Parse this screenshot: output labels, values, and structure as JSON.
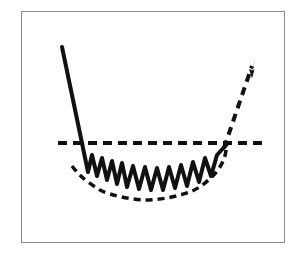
{
  "figure": {
    "title": "Market bottoming and recovery pattern",
    "background_color": "#ffffff",
    "frame": {
      "border_color": "#8a8a8a",
      "border_width": 1,
      "x": 21,
      "y": 11,
      "width": 264,
      "height": 232
    },
    "stroke_color": "#111111"
  },
  "chart_data": {
    "type": "line",
    "title": "Market bottoming and recovery pattern",
    "subtitle": "",
    "xlabel": "",
    "ylabel": "",
    "xlim": [
      0,
      297
    ],
    "ylim": [
      265,
      0
    ],
    "grid": false,
    "legend": "none",
    "annotations": [
      {
        "name": "support-level",
        "text": "",
        "style": "horizontal dashed reference line",
        "y": 143
      },
      {
        "name": "uptrend-arrow",
        "text": "",
        "style": "dashed arrow pointing up-right",
        "tip_x": 256,
        "tip_y": 57
      }
    ],
    "series": [
      {
        "name": "decline-and-oscillation",
        "style": "solid",
        "color": "#111111",
        "width": 4,
        "points": [
          [
            62,
            47
          ],
          [
            88,
            172
          ],
          [
            92,
            155
          ],
          [
            97,
            176
          ],
          [
            102,
            158
          ],
          [
            107,
            180
          ],
          [
            112,
            161
          ],
          [
            117,
            184
          ],
          [
            122,
            163
          ],
          [
            127,
            187
          ],
          [
            133,
            166
          ],
          [
            139,
            189
          ],
          [
            145,
            167
          ],
          [
            151,
            190
          ],
          [
            157,
            168
          ],
          [
            163,
            190
          ],
          [
            169,
            167
          ],
          [
            175,
            188
          ],
          [
            181,
            165
          ],
          [
            187,
            186
          ],
          [
            193,
            162
          ],
          [
            199,
            182
          ],
          [
            205,
            158
          ],
          [
            211,
            176
          ],
          [
            217,
            155
          ],
          [
            228,
            143
          ]
        ]
      },
      {
        "name": "lower-envelope",
        "style": "dashed",
        "color": "#111111",
        "width": 3.5,
        "dash": "7,5",
        "points": [
          [
            72,
            166
          ],
          [
            85,
            180
          ],
          [
            100,
            190
          ],
          [
            120,
            197
          ],
          [
            145,
            200
          ],
          [
            170,
            198
          ],
          [
            190,
            192
          ],
          [
            207,
            182
          ],
          [
            218,
            170
          ],
          [
            224,
            158
          ],
          [
            226,
            149
          ]
        ]
      },
      {
        "name": "support-line",
        "style": "dashed",
        "color": "#111111",
        "width": 4,
        "dash": "9,6",
        "points": [
          [
            58,
            143
          ],
          [
            262,
            143
          ]
        ]
      },
      {
        "name": "recovery-arrow",
        "style": "dashed",
        "color": "#111111",
        "width": 4,
        "dash": "8,6",
        "points": [
          [
            224,
            148
          ],
          [
            253,
            63
          ]
        ]
      }
    ]
  }
}
